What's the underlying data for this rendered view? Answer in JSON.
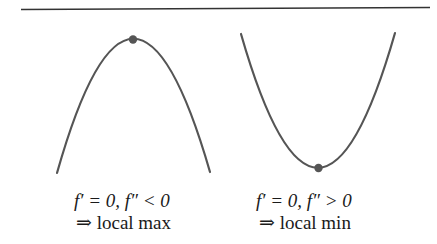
{
  "figure": {
    "rule_color": "#333333",
    "curve_color": "#555555",
    "point_color": "#555555",
    "panels": [
      {
        "id": "local-max",
        "shape": "concave-down parabola",
        "condition": "f′ = 0, f″ < 0",
        "conclusion": "⇒ local max",
        "critical_point": "top"
      },
      {
        "id": "local-min",
        "shape": "concave-up parabola",
        "condition": "f′ = 0, f″ > 0",
        "conclusion": "⇒ local min",
        "critical_point": "bottom"
      }
    ]
  }
}
